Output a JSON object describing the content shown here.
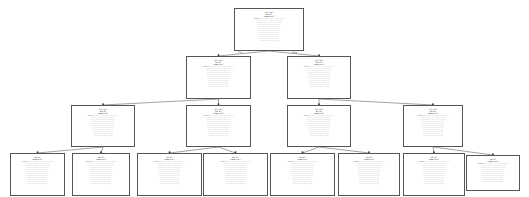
{
  "legibility_note": "Node text is too small to read at source resolution; the values below are placeholders, not transcribed from the image.",
  "edge_labels": {
    "true": "True",
    "false": "False"
  },
  "nodes": [
    {
      "id": "root",
      "level": 0,
      "box": [
        234,
        8,
        70,
        43
      ],
      "cond": "X[?] <= ?",
      "impurity": "gini = ?",
      "samples": "samples = ?",
      "value_rows": 12
    },
    {
      "id": "n1",
      "level": 1,
      "box": [
        186,
        56,
        65,
        43
      ],
      "cond": "X[?] <= ?",
      "impurity": "gini = ?",
      "samples": "samples = ?",
      "value_rows": 11
    },
    {
      "id": "n2",
      "level": 1,
      "box": [
        287,
        56,
        64,
        43
      ],
      "cond": "X[?] <= ?",
      "impurity": "gini = ?",
      "samples": "samples = ?",
      "value_rows": 11
    },
    {
      "id": "n3",
      "level": 2,
      "box": [
        71,
        105,
        64,
        42
      ],
      "cond": "X[?] <= ?",
      "impurity": "gini = ?",
      "samples": "samples = ?",
      "value_rows": 11
    },
    {
      "id": "n4",
      "level": 2,
      "box": [
        186,
        105,
        65,
        42
      ],
      "cond": "X[?] <= ?",
      "impurity": "gini = ?",
      "samples": "samples = ?",
      "value_rows": 11
    },
    {
      "id": "n5",
      "level": 2,
      "box": [
        287,
        105,
        64,
        42
      ],
      "cond": "X[?] <= ?",
      "impurity": "gini = ?",
      "samples": "samples = ?",
      "value_rows": 11
    },
    {
      "id": "n6",
      "level": 2,
      "box": [
        403,
        105,
        60,
        42
      ],
      "cond": "X[?] <= ?",
      "impurity": "gini = ?",
      "samples": "samples = ?",
      "value_rows": 11
    },
    {
      "id": "l1",
      "level": 3,
      "box": [
        10,
        153,
        55,
        43
      ],
      "cond": "",
      "impurity": "gini = ?",
      "samples": "samples = ?",
      "value_rows": 12
    },
    {
      "id": "l2",
      "level": 3,
      "box": [
        72,
        153,
        58,
        43
      ],
      "cond": "",
      "impurity": "gini = ?",
      "samples": "samples = ?",
      "value_rows": 12
    },
    {
      "id": "l3",
      "level": 3,
      "box": [
        137,
        153,
        65,
        43
      ],
      "cond": "",
      "impurity": "gini = ?",
      "samples": "samples = ?",
      "value_rows": 12
    },
    {
      "id": "l4",
      "level": 3,
      "box": [
        203,
        153,
        65,
        43
      ],
      "cond": "",
      "impurity": "gini = ?",
      "samples": "samples = ?",
      "value_rows": 12
    },
    {
      "id": "l5",
      "level": 3,
      "box": [
        270,
        153,
        65,
        43
      ],
      "cond": "",
      "impurity": "gini = ?",
      "samples": "samples = ?",
      "value_rows": 12
    },
    {
      "id": "l6",
      "level": 3,
      "box": [
        338,
        153,
        62,
        43
      ],
      "cond": "",
      "impurity": "gini = ?",
      "samples": "samples = ?",
      "value_rows": 12
    },
    {
      "id": "l7",
      "level": 3,
      "box": [
        403,
        153,
        62,
        43
      ],
      "cond": "",
      "impurity": "gini = ?",
      "samples": "samples = ?",
      "value_rows": 12
    },
    {
      "id": "l8",
      "level": 3,
      "box": [
        466,
        155,
        54,
        36
      ],
      "cond": "",
      "impurity": "gini = ?",
      "samples": "samples = ?",
      "value_rows": 10
    }
  ],
  "edges": [
    [
      "root",
      "n1"
    ],
    [
      "root",
      "n2"
    ],
    [
      "n1",
      "n3"
    ],
    [
      "n1",
      "n4"
    ],
    [
      "n2",
      "n5"
    ],
    [
      "n2",
      "n6"
    ],
    [
      "n3",
      "l1"
    ],
    [
      "n3",
      "l2"
    ],
    [
      "n4",
      "l3"
    ],
    [
      "n4",
      "l4"
    ],
    [
      "n5",
      "l5"
    ],
    [
      "n5",
      "l6"
    ],
    [
      "n6",
      "l7"
    ],
    [
      "n6",
      "l8"
    ]
  ]
}
